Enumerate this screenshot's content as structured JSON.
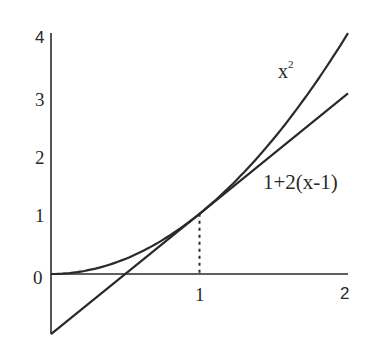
{
  "chart_data": {
    "type": "line",
    "title": "",
    "xlabel": "",
    "ylabel": "",
    "xlim": [
      0,
      2
    ],
    "ylim": [
      -1,
      4
    ],
    "grid": false,
    "legend": "none (inline curve labels)",
    "x_ticks": [
      "1",
      "2"
    ],
    "y_ticks": [
      "0",
      "1",
      "2",
      "3",
      "4"
    ],
    "series": [
      {
        "name": "x^2",
        "label": "x",
        "label_sup": "2",
        "x": [
          0,
          0.25,
          0.5,
          0.75,
          1,
          1.25,
          1.5,
          1.75,
          2
        ],
        "values": [
          0,
          0.0625,
          0.25,
          0.5625,
          1,
          1.5625,
          2.25,
          3.0625,
          4
        ]
      },
      {
        "name": "1+2(x-1)",
        "label": "1+2(x-1)",
        "x": [
          0,
          1,
          2
        ],
        "values": [
          -1,
          1,
          3
        ]
      }
    ],
    "annotations": [
      {
        "type": "dotted-vertical-line",
        "x": 1,
        "from_y": 0,
        "to_y": 1,
        "note": "point of tangency (1,1)"
      }
    ]
  },
  "labels": {
    "y0": "0",
    "y1": "1",
    "y2": "2",
    "y3": "3",
    "y4": "4",
    "x1": "1",
    "x2": "2",
    "curve_base": "x",
    "curve_exp": "2",
    "tangent": "1+2(x-1)"
  },
  "colors": {
    "ink": "#2a2a2a",
    "background": "#ffffff"
  }
}
